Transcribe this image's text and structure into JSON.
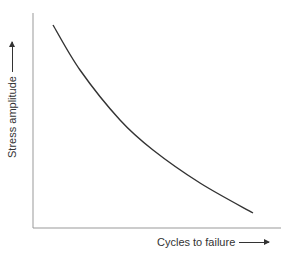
{
  "chart_data": {
    "type": "line",
    "title": "",
    "xlabel": "Cycles to failure",
    "ylabel": "Stress amplitude",
    "x_ticks": [],
    "y_ticks": [],
    "grid": false,
    "legend": null,
    "series": [
      {
        "name": "S-N curve",
        "description": "Qualitative fatigue curve: stress amplitude decreasing with cycles to failure (no numeric scale)",
        "points_px": [
          [
            53,
            25
          ],
          [
            80,
            70
          ],
          [
            120,
            120
          ],
          [
            153,
            150
          ],
          [
            200,
            183
          ],
          [
            253,
            213
          ]
        ]
      }
    ],
    "axis_arrows": {
      "x": "right",
      "y": "up"
    }
  },
  "colors": {
    "axis": "#888888",
    "curve": "#333333",
    "text": "#333333"
  }
}
